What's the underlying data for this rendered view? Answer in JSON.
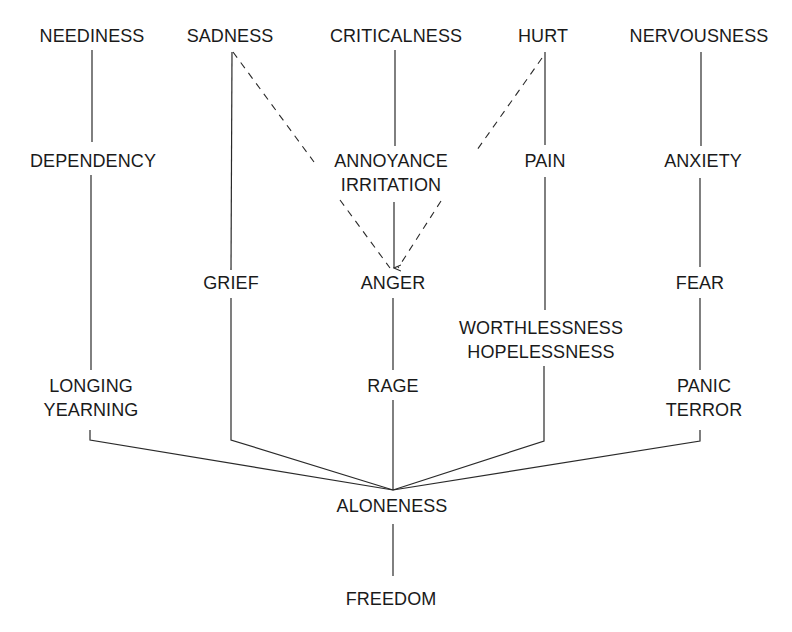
{
  "diagram": {
    "type": "emotion-flow",
    "colors": {
      "line": "#2a2a2a",
      "text": "#1a1a1a",
      "background": "#ffffff"
    },
    "nodes": {
      "neediness": {
        "lines": [
          "NEEDINESS"
        ]
      },
      "sadness": {
        "lines": [
          "SADNESS"
        ]
      },
      "criticalness": {
        "lines": [
          "CRITICALNESS"
        ]
      },
      "hurt": {
        "lines": [
          "HURT"
        ]
      },
      "nervousness": {
        "lines": [
          "NERVOUSNESS"
        ]
      },
      "dependency": {
        "lines": [
          "DEPENDENCY"
        ]
      },
      "annoyance": {
        "lines": [
          "ANNOYANCE",
          "IRRITATION"
        ]
      },
      "pain": {
        "lines": [
          "PAIN"
        ]
      },
      "anxiety": {
        "lines": [
          "ANXIETY"
        ]
      },
      "grief": {
        "lines": [
          "GRIEF"
        ]
      },
      "anger": {
        "lines": [
          "ANGER"
        ]
      },
      "fear": {
        "lines": [
          "FEAR"
        ]
      },
      "worthlessness": {
        "lines": [
          "WORTHLESSNESS",
          "HOPELESSNESS"
        ]
      },
      "longing": {
        "lines": [
          "LONGING",
          "YEARNING"
        ]
      },
      "rage": {
        "lines": [
          "RAGE"
        ]
      },
      "panic": {
        "lines": [
          "PANIC",
          "TERROR"
        ]
      },
      "aloneness": {
        "lines": [
          "ALONENESS"
        ]
      },
      "freedom": {
        "lines": [
          "FREEDOM"
        ]
      }
    },
    "edges": [
      {
        "from": "NEEDINESS",
        "to": "DEPENDENCY",
        "style": "solid"
      },
      {
        "from": "DEPENDENCY",
        "to": "LONGING YEARNING",
        "style": "solid"
      },
      {
        "from": "LONGING YEARNING",
        "to": "ALONENESS",
        "style": "solid"
      },
      {
        "from": "SADNESS",
        "to": "GRIEF",
        "style": "solid"
      },
      {
        "from": "GRIEF",
        "to": "ALONENESS",
        "style": "solid"
      },
      {
        "from": "SADNESS",
        "to": "ANGER",
        "style": "dashed",
        "arrow": true
      },
      {
        "from": "CRITICALNESS",
        "to": "ANNOYANCE IRRITATION",
        "style": "solid"
      },
      {
        "from": "ANNOYANCE IRRITATION",
        "to": "ANGER",
        "style": "solid",
        "arrow": true
      },
      {
        "from": "ANGER",
        "to": "RAGE",
        "style": "solid"
      },
      {
        "from": "RAGE",
        "to": "ALONENESS",
        "style": "solid"
      },
      {
        "from": "HURT",
        "to": "ANGER",
        "style": "dashed",
        "arrow": true
      },
      {
        "from": "HURT",
        "to": "PAIN",
        "style": "solid"
      },
      {
        "from": "PAIN",
        "to": "WORTHLESSNESS HOPELESSNESS",
        "style": "solid"
      },
      {
        "from": "WORTHLESSNESS HOPELESSNESS",
        "to": "ALONENESS",
        "style": "solid"
      },
      {
        "from": "NERVOUSNESS",
        "to": "ANXIETY",
        "style": "solid"
      },
      {
        "from": "ANXIETY",
        "to": "FEAR",
        "style": "solid"
      },
      {
        "from": "FEAR",
        "to": "PANIC TERROR",
        "style": "solid"
      },
      {
        "from": "PANIC TERROR",
        "to": "ALONENESS",
        "style": "solid"
      },
      {
        "from": "ALONENESS",
        "to": "FREEDOM",
        "style": "solid"
      }
    ]
  }
}
